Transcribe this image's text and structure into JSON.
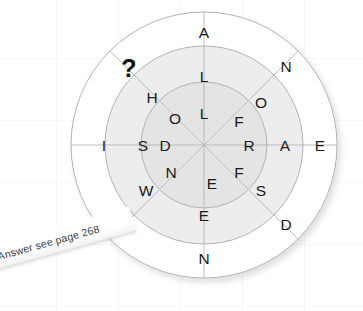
{
  "puzzle": {
    "type": "word-wheel",
    "title": "Word Wheel Puzzle",
    "sectors": 8,
    "rings": 3,
    "missing_marker": "?",
    "geometry": {
      "center_x": 204,
      "center_y": 145,
      "radius_outer": 133,
      "radius_middle": 99,
      "radius_inner": 63,
      "radius_hub": 0
    },
    "colors": {
      "outer_ring_fill": "#ffffff",
      "middle_ring_fill": "#ededed",
      "inner_ring_fill": "#e4e4e4",
      "stroke": "#aeaeae",
      "letter": "#1a1a1a",
      "question_mark": "#111111",
      "page_background": "#ffffff",
      "grid_line": "#f2f2f2"
    },
    "ring_labels": {
      "outer": "outer-ring",
      "middle": "middle-ring",
      "inner": "inner-ring"
    },
    "outer_ring": [
      "A",
      "N",
      "E",
      "D",
      "N",
      "O",
      "I",
      "?"
    ],
    "middle_ring": [
      "L",
      "O",
      "A",
      "S",
      "E",
      "W",
      "S",
      "H"
    ],
    "inner_ring": [
      "L",
      "F",
      "R",
      "F",
      "E",
      "N",
      "D",
      "O"
    ],
    "sector_angles_deg": [
      270,
      315,
      0,
      45,
      90,
      135,
      180,
      225
    ]
  },
  "answer_note": {
    "text": "Answer see page 268",
    "page_number": "268"
  }
}
